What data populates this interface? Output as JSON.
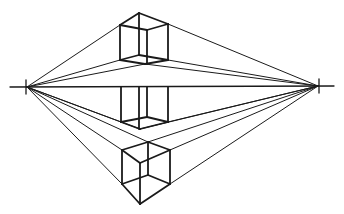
{
  "diagram": {
    "title": "",
    "type": "two-point-perspective",
    "colors": {
      "background": "#ffffff",
      "stroke": "#1a1a1a"
    },
    "horizon": {
      "x1": 10,
      "x2": 334,
      "y_left": 87,
      "y_right": 86
    },
    "vanishing_points": [
      {
        "name": "left",
        "x": 27,
        "y": 87
      },
      {
        "name": "right",
        "x": 318,
        "y": 86
      }
    ],
    "cubes": [
      {
        "position": "above-horizon"
      },
      {
        "position": "on-horizon"
      },
      {
        "position": "below-horizon"
      }
    ]
  }
}
